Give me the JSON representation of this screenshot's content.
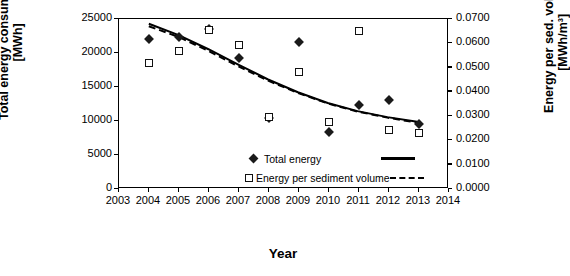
{
  "chart_data": {
    "type": "scatter",
    "title": "",
    "xlabel": "Year",
    "ylabel_left": "Total energy consumption [MWh]",
    "ylabel_right": "Energy per sed. volume [MWh/m3]",
    "ylabel_left_line1": "Total energy consumption",
    "ylabel_left_line2": "[MWh]",
    "ylabel_right_line1": "Energy per sed. volume",
    "ylabel_right_line2": "[MWh/m³]",
    "x_ticks": [
      "2003",
      "2004",
      "2005",
      "2006",
      "2007",
      "2008",
      "2009",
      "2010",
      "2011",
      "2012",
      "2013",
      "2014"
    ],
    "xlim": [
      2003,
      2014
    ],
    "y_ticks_left": [
      "0",
      "5000",
      "10000",
      "15000",
      "20000",
      "25000"
    ],
    "ylim_left": [
      0,
      25000
    ],
    "y_ticks_right": [
      "0.0000",
      "0.0100",
      "0.0200",
      "0.0300",
      "0.0400",
      "0.0500",
      "0.0600",
      "0.0700"
    ],
    "ylim_right": [
      0.0,
      0.07
    ],
    "grid": false,
    "legend_position": "inside-lower-left",
    "legend": [
      {
        "label": "Total energy",
        "marker": "filled-diamond",
        "line": "solid"
      },
      {
        "label": "Energy per sediment volume",
        "marker": "open-square",
        "line": "dashed"
      }
    ],
    "series": [
      {
        "name": "Total energy",
        "axis": "left",
        "marker": "filled-diamond",
        "x": [
          2004,
          2005,
          2006,
          2007,
          2008,
          2009,
          2010,
          2011,
          2012,
          2013
        ],
        "values": [
          22100,
          22400,
          23500,
          19200,
          10500,
          21600,
          8400,
          12300,
          13100,
          9500
        ]
      },
      {
        "name": "Energy per sediment volume",
        "axis": "right",
        "marker": "open-square",
        "x": [
          2004,
          2005,
          2006,
          2007,
          2008,
          2009,
          2010,
          2011,
          2012,
          2013
        ],
        "values": [
          0.0518,
          0.057,
          0.0655,
          0.0595,
          0.0295,
          0.048,
          0.0275,
          0.065,
          0.0245,
          0.0232
        ]
      },
      {
        "name": "Total energy trend",
        "axis": "left",
        "line": "solid",
        "x": [
          2004,
          2005,
          2006,
          2007,
          2008,
          2009,
          2010,
          2011,
          2012,
          2013
        ],
        "values": [
          24300,
          22600,
          20500,
          18200,
          16000,
          14100,
          12500,
          11300,
          10400,
          9700
        ]
      },
      {
        "name": "Energy per sediment volume trend",
        "axis": "right",
        "line": "dashed",
        "x": [
          2004,
          2005,
          2006,
          2007,
          2008,
          2009,
          2010,
          2011,
          2012,
          2013
        ],
        "values": [
          0.067,
          0.0625,
          0.0567,
          0.0503,
          0.0443,
          0.0392,
          0.0348,
          0.0314,
          0.0289,
          0.0268
        ]
      }
    ]
  }
}
